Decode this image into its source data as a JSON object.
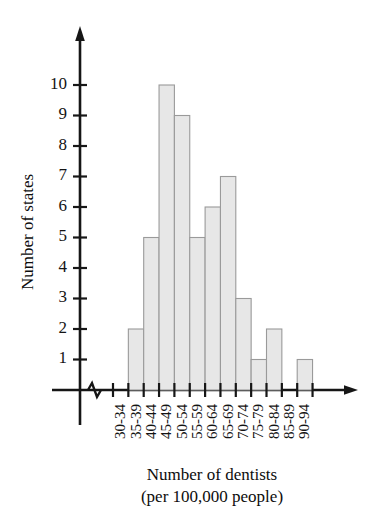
{
  "chart_data": {
    "type": "bar",
    "title": "",
    "xlabel": "Number of dentists",
    "xlabel_line2": "(per 100,000 people)",
    "ylabel": "Number of states",
    "categories": [
      "30-34",
      "35-39",
      "40-44",
      "45-49",
      "50-54",
      "55-59",
      "60-64",
      "65-69",
      "70-74",
      "75-79",
      "80-84",
      "85-89",
      "90-94"
    ],
    "values": [
      0,
      2,
      5,
      10,
      9,
      5,
      6,
      7,
      3,
      1,
      2,
      0,
      1
    ],
    "ylim": [
      0,
      10
    ],
    "ytick_labels": [
      "1",
      "2",
      "3",
      "4",
      "5",
      "6",
      "7",
      "8",
      "9",
      "10"
    ],
    "ytick_values": [
      1,
      2,
      3,
      4,
      5,
      6,
      7,
      8,
      9,
      10
    ],
    "grid": false,
    "legend": "none",
    "axis_break": true,
    "bar_fill_color": "#e7e7e7",
    "bar_stroke_color": "#9a9a9a",
    "axis_color": "#161616"
  },
  "axes": {
    "y_title": "Number of states",
    "x_title_line1": "Number of dentists",
    "x_title_line2": "(per 100,000 people)"
  }
}
